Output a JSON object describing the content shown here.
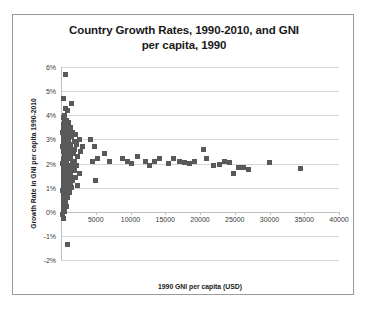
{
  "chart_data": {
    "type": "scatter",
    "title": "Country Growth Rates, 1990-2010, and GNI per capita, 1990",
    "title_line1": "Country Growth Rates, 1990-2010, and GNI",
    "title_line2": "per capita, 1990",
    "xlabel": "1990 GNI per capita (USD)",
    "ylabel": "Growth Rate in GNI per capita 1990-2010",
    "xlim": [
      0,
      40000
    ],
    "ylim": [
      -0.02,
      0.06
    ],
    "xticks": [
      5000,
      10000,
      15000,
      20000,
      25000,
      30000,
      35000,
      40000
    ],
    "xtick_labels": [
      "5000",
      "10000",
      "15000",
      "20000",
      "25000",
      "30000",
      "35000",
      "40000"
    ],
    "yticks": [
      0.06,
      0.05,
      0.04,
      0.03,
      0.02,
      0.01,
      0.0,
      -0.01,
      -0.02
    ],
    "ytick_labels": [
      "6%",
      "5%",
      "4%",
      "3%",
      "2%",
      "1%",
      "0%",
      "-1%",
      "-2%"
    ],
    "grid": true,
    "legend": false,
    "marker_color": "#595959",
    "marker_shape": "square",
    "series": [
      {
        "name": "Countries",
        "points": [
          [
            600,
            0.057
          ],
          [
            400,
            0.047
          ],
          [
            1500,
            0.045
          ],
          [
            700,
            0.043
          ],
          [
            900,
            0.042
          ],
          [
            500,
            0.04
          ],
          [
            350,
            0.039
          ],
          [
            800,
            0.038
          ],
          [
            450,
            0.037
          ],
          [
            1100,
            0.037
          ],
          [
            300,
            0.036
          ],
          [
            650,
            0.035
          ],
          [
            1300,
            0.035
          ],
          [
            400,
            0.034
          ],
          [
            900,
            0.034
          ],
          [
            1700,
            0.033
          ],
          [
            250,
            0.033
          ],
          [
            600,
            0.032
          ],
          [
            1200,
            0.032
          ],
          [
            2100,
            0.032
          ],
          [
            350,
            0.031
          ],
          [
            800,
            0.031
          ],
          [
            1500,
            0.031
          ],
          [
            2600,
            0.03
          ],
          [
            300,
            0.03
          ],
          [
            700,
            0.03
          ],
          [
            1100,
            0.029
          ],
          [
            1900,
            0.029
          ],
          [
            400,
            0.028
          ],
          [
            900,
            0.028
          ],
          [
            1400,
            0.028
          ],
          [
            2300,
            0.028
          ],
          [
            3100,
            0.027
          ],
          [
            250,
            0.027
          ],
          [
            650,
            0.027
          ],
          [
            1250,
            0.026
          ],
          [
            2000,
            0.026
          ],
          [
            350,
            0.026
          ],
          [
            800,
            0.025
          ],
          [
            1600,
            0.025
          ],
          [
            2800,
            0.025
          ],
          [
            300,
            0.025
          ],
          [
            550,
            0.024
          ],
          [
            1000,
            0.024
          ],
          [
            1800,
            0.024
          ],
          [
            450,
            0.023
          ],
          [
            900,
            0.023
          ],
          [
            1400,
            0.023
          ],
          [
            2400,
            0.023
          ],
          [
            300,
            0.022
          ],
          [
            700,
            0.022
          ],
          [
            1200,
            0.022
          ],
          [
            2000,
            0.021
          ],
          [
            400,
            0.021
          ],
          [
            850,
            0.021
          ],
          [
            1600,
            0.02
          ],
          [
            250,
            0.02
          ],
          [
            600,
            0.02
          ],
          [
            1100,
            0.019
          ],
          [
            2200,
            0.019
          ],
          [
            350,
            0.019
          ],
          [
            800,
            0.018
          ],
          [
            1500,
            0.018
          ],
          [
            300,
            0.017
          ],
          [
            950,
            0.017
          ],
          [
            1900,
            0.017
          ],
          [
            450,
            0.016
          ],
          [
            1200,
            0.016
          ],
          [
            2600,
            0.016
          ],
          [
            300,
            0.015
          ],
          [
            750,
            0.015
          ],
          [
            1400,
            0.015
          ],
          [
            2100,
            0.014
          ],
          [
            400,
            0.014
          ],
          [
            900,
            0.013
          ],
          [
            1700,
            0.013
          ],
          [
            300,
            0.012
          ],
          [
            600,
            0.012
          ],
          [
            1300,
            0.011
          ],
          [
            2400,
            0.011
          ],
          [
            350,
            0.011
          ],
          [
            800,
            0.01
          ],
          [
            1500,
            0.01
          ],
          [
            250,
            0.009
          ],
          [
            700,
            0.008
          ],
          [
            1200,
            0.008
          ],
          [
            400,
            0.007
          ],
          [
            900,
            0.006
          ],
          [
            300,
            0.005
          ],
          [
            600,
            0.004
          ],
          [
            350,
            0.003
          ],
          [
            800,
            0.002
          ],
          [
            300,
            0.001
          ],
          [
            500,
            0.0
          ],
          [
            250,
            -0.001
          ],
          [
            400,
            -0.003
          ],
          [
            1000,
            -0.0135
          ],
          [
            4300,
            0.03
          ],
          [
            4800,
            0.027
          ],
          [
            5300,
            0.022
          ],
          [
            4600,
            0.021
          ],
          [
            5000,
            0.013
          ],
          [
            6200,
            0.024
          ],
          [
            7000,
            0.021
          ],
          [
            8800,
            0.022
          ],
          [
            9500,
            0.021
          ],
          [
            10200,
            0.02
          ],
          [
            11000,
            0.023
          ],
          [
            12200,
            0.021
          ],
          [
            12800,
            0.019
          ],
          [
            13500,
            0.021
          ],
          [
            14200,
            0.022
          ],
          [
            15500,
            0.02
          ],
          [
            16200,
            0.022
          ],
          [
            17000,
            0.021
          ],
          [
            17800,
            0.0205
          ],
          [
            18500,
            0.02
          ],
          [
            19200,
            0.021
          ],
          [
            20500,
            0.026
          ],
          [
            21000,
            0.022
          ],
          [
            22000,
            0.019
          ],
          [
            22800,
            0.0195
          ],
          [
            23500,
            0.021
          ],
          [
            24200,
            0.0205
          ],
          [
            24800,
            0.016
          ],
          [
            25500,
            0.0185
          ],
          [
            26200,
            0.0185
          ],
          [
            27000,
            0.0175
          ],
          [
            30000,
            0.0205
          ],
          [
            34500,
            0.018
          ]
        ]
      }
    ]
  }
}
